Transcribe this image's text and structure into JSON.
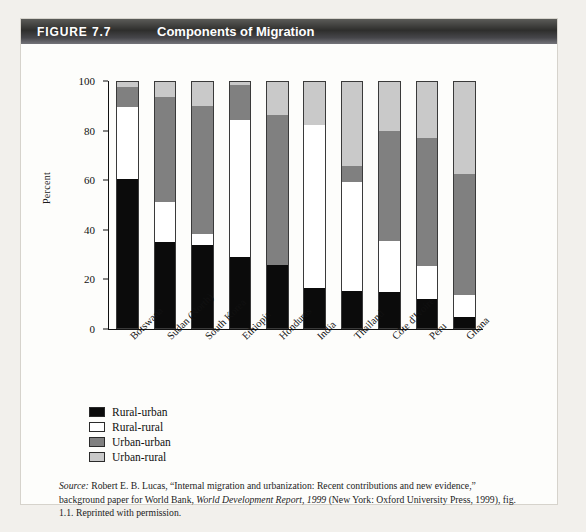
{
  "figure": {
    "number_label": "FIGURE 7.7",
    "title": "Components of Migration"
  },
  "source_note": {
    "source_word": "Source:",
    "line1": " Robert E. B. Lucas, “Internal migration and urbanization: Recent contributions and new evidence,”",
    "line2_pre": "background paper for World Bank, ",
    "line2_italic": "World Development Report, 1999",
    "line2_post": " (New York: Oxford University Press,",
    "line3": "1999), fig. 1.1. Reprinted with permission."
  },
  "chart_data": {
    "type": "bar",
    "subtype": "stacked-bar-100",
    "title": "Components of Migration",
    "xlabel": "",
    "ylabel": "Percent",
    "ylim": [
      0,
      100
    ],
    "yticks": [
      0,
      20,
      40,
      60,
      80,
      100
    ],
    "grid": false,
    "legend_position": "below-left",
    "categories": [
      "Botswana",
      "Sudan (North)",
      "South Korea",
      "Ethiopia",
      "Honduras",
      "India",
      "Thailand",
      "Côte d'Ivoire",
      "Peru",
      "Ghana"
    ],
    "series": [
      {
        "name": "Rural-urban",
        "color": "#0b0b0b",
        "values": [
          60.0,
          34.5,
          33.5,
          28.5,
          25.5,
          16.0,
          15.0,
          14.5,
          11.5,
          4.5
        ]
      },
      {
        "name": "Rural-rural",
        "color": "#ffffff",
        "values": [
          29.0,
          16.5,
          4.5,
          55.5,
          0.0,
          66.0,
          44.0,
          20.5,
          13.5,
          9.0
        ]
      },
      {
        "name": "Urban-urban",
        "color": "#808080",
        "values": [
          8.0,
          42.0,
          51.5,
          14.0,
          60.5,
          0.0,
          6.5,
          44.5,
          51.5,
          48.5
        ]
      },
      {
        "name": "Urban-rural",
        "color": "#c9c9c9",
        "values": [
          3.0,
          7.0,
          10.5,
          2.0,
          14.0,
          18.0,
          34.5,
          20.5,
          23.5,
          38.0
        ]
      }
    ],
    "cumulative_tops": {
      "Botswana": [
        60.0,
        89.0,
        97.0,
        100.0
      ],
      "Sudan (North)": [
        34.5,
        51.0,
        93.0,
        100.0
      ],
      "South Korea": [
        33.5,
        38.0,
        89.5,
        100.0
      ],
      "Ethiopia": [
        28.5,
        84.0,
        98.0,
        100.0
      ],
      "Honduras": [
        25.5,
        25.5,
        86.0,
        100.0
      ],
      "India": [
        16.0,
        82.0,
        82.0,
        100.0
      ],
      "Thailand": [
        15.0,
        59.0,
        65.5,
        100.0
      ],
      "Côte d'Ivoire": [
        14.5,
        35.0,
        79.5,
        100.0
      ],
      "Peru": [
        11.5,
        25.0,
        76.5,
        100.0
      ],
      "Ghana": [
        4.5,
        13.5,
        62.0,
        100.0
      ]
    }
  }
}
